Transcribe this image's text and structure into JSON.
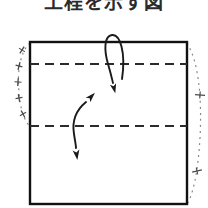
{
  "page": {
    "width": 208,
    "height": 208,
    "background_color": "#ffffff",
    "kind": "origami-fold-instruction-diagram"
  },
  "caption": {
    "text": "工程を示す図",
    "note": "top caption row is cropped off by the top edge of the screenshot"
  },
  "colors": {
    "ink": "#1a1a1a",
    "sheet_outline": "#111111",
    "fold_line": "#2b2b2b",
    "guide_dotted": "#8a8a8a",
    "paper_fill": "#ffffff"
  },
  "diagram": {
    "sheet": {
      "label": "paper-sheet",
      "x": 30,
      "y": 42,
      "width": 157,
      "height": 162,
      "stroke_width": 2.4
    },
    "fold_lines": [
      {
        "name": "upper-fold-line",
        "y": 64,
        "x1": 30,
        "x2": 187,
        "style": "dashed",
        "dash": "9 6",
        "stroke_width": 2.2
      },
      {
        "name": "lower-fold-line",
        "y": 126,
        "x1": 30,
        "x2": 187,
        "style": "dashed",
        "dash": "9 6",
        "stroke_width": 2.2
      }
    ],
    "arrows": [
      {
        "name": "fold-down-arrow",
        "type": "single-headed-curved",
        "meaning": "fold the top edge down along the upper fold line",
        "path": "M 122 79 C 126 52 120 34 112 35 C 104 36 104 50 108 64 C 111 75 112 80 113 84",
        "head_at": [
          113,
          86
        ],
        "head_angle_deg": 74
      },
      {
        "name": "fold-unfold-double-arrow",
        "type": "double-headed-curved",
        "meaning": "fold and unfold along the lower fold line",
        "path": "M 87 101 C 75 110 72 122 74 134 C 75 142 76 146 76 149",
        "head_top_at": [
          88,
          99
        ],
        "head_top_angle_deg": -46,
        "head_bottom_at": [
          76,
          151
        ],
        "head_bottom_angle_deg": 80
      }
    ],
    "guides": [
      {
        "name": "left-measure-guide",
        "type": "dotted-curve",
        "side": "left",
        "path": "M 30 43 C 20 52 17 72 19 92 C 20 108 24 120 30 127",
        "dash": "2 4",
        "ticks": [
          {
            "name": "left-tick-1",
            "cx": 22,
            "cy": 50,
            "angle_deg": -58
          },
          {
            "name": "left-tick-2",
            "cx": 19,
            "cy": 66,
            "angle_deg": -76
          },
          {
            "name": "left-tick-3",
            "cx": 18,
            "cy": 82,
            "angle_deg": -86
          },
          {
            "name": "left-tick-4",
            "cx": 19,
            "cy": 98,
            "angle_deg": -100
          },
          {
            "name": "left-tick-5",
            "cx": 23,
            "cy": 114,
            "angle_deg": -118
          }
        ]
      },
      {
        "name": "right-measure-guide",
        "type": "dotted-curve",
        "side": "right",
        "path": "M 187 43 C 199 62 202 100 200 138 C 198 172 193 195 187 204",
        "dash": "2 4",
        "ticks": [
          {
            "name": "right-tick-1",
            "cx": 200,
            "cy": 95,
            "angle_deg": 4
          },
          {
            "name": "right-tick-2",
            "cx": 197,
            "cy": 171,
            "angle_deg": -12
          }
        ]
      }
    ]
  }
}
